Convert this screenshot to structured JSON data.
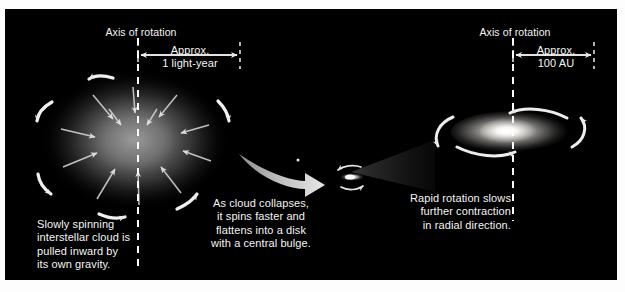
{
  "figure": {
    "background_color": "#ffffff",
    "panel_color": "#000000",
    "text_color": "#f4f4f4"
  },
  "left_stage": {
    "axis_title": "Axis of rotation",
    "dimension_label": "Approx.\n1 light-year",
    "caption": "Slowly spinning\ninterstellar cloud is\npulled inward by\nits own gravity.",
    "object_name": "interstellar-cloud"
  },
  "middle_stage": {
    "caption": "As cloud collapses,\nit spins faster and\nflattens into a disk\nwith a central bulge.",
    "object_name": "collapsing-disk"
  },
  "right_stage": {
    "axis_title": "Axis of rotation",
    "dimension_label": "Approx.\n100 AU",
    "caption": "Rapid rotation slows\nfurther contraction\nin radial direction.",
    "object_name": "protoplanetary-disk"
  }
}
